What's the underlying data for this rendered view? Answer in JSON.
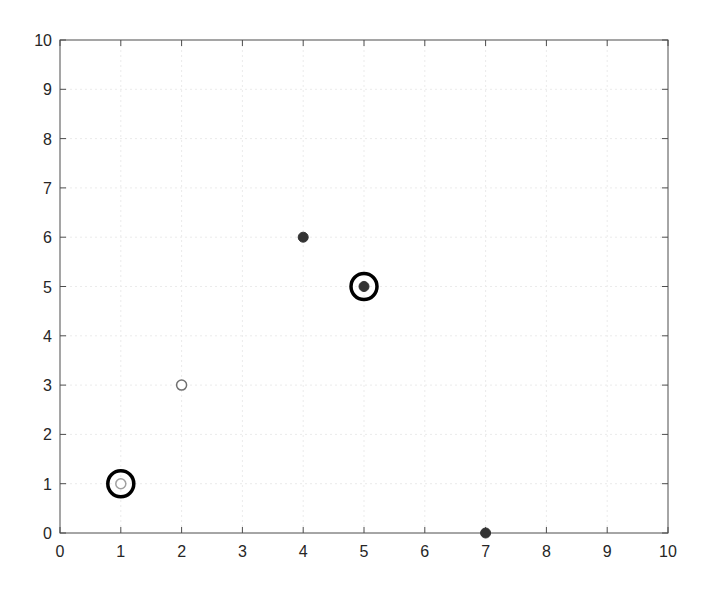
{
  "chart_data": {
    "type": "scatter",
    "title": "",
    "xlabel": "",
    "ylabel": "",
    "xlim": [
      0,
      10
    ],
    "ylim": [
      0,
      10
    ],
    "xticks": [
      0,
      1,
      2,
      3,
      4,
      5,
      6,
      7,
      8,
      9,
      10
    ],
    "yticks": [
      0,
      1,
      2,
      3,
      4,
      5,
      6,
      7,
      8,
      9,
      10
    ],
    "xtick_labels": [
      "0",
      "1",
      "2",
      "3",
      "4",
      "5",
      "6",
      "7",
      "8",
      "9",
      "10"
    ],
    "ytick_labels": [
      "0",
      "1",
      "2",
      "3",
      "4",
      "5",
      "6",
      "7",
      "8",
      "9",
      "10"
    ],
    "grid": true,
    "legend": null,
    "points": [
      {
        "x": 1,
        "y": 1,
        "marker": "open",
        "color": "#a0a0a0",
        "highlighted": true
      },
      {
        "x": 2,
        "y": 3,
        "marker": "open",
        "color": "#707070",
        "highlighted": false
      },
      {
        "x": 4,
        "y": 6,
        "marker": "filled",
        "color": "#333333",
        "highlighted": false
      },
      {
        "x": 5,
        "y": 5,
        "marker": "filled",
        "color": "#333333",
        "highlighted": true
      },
      {
        "x": 7,
        "y": 0,
        "marker": "filled",
        "color": "#333333",
        "highlighted": false
      }
    ],
    "highlight_ring_color": "#000000"
  },
  "layout": {
    "plot_left": 60,
    "plot_top": 40,
    "plot_right": 668,
    "plot_bottom": 533
  }
}
